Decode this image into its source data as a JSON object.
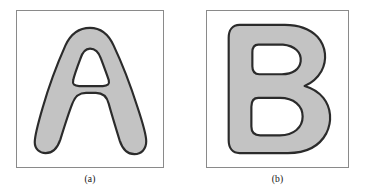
{
  "figure": {
    "background_color": "#ffffff",
    "panel_border_color": "#8a8a8a",
    "shape_fill_color": "#c3c3c3",
    "shape_outline_color": "#2b2b2b",
    "counter_fill_color": "#ffffff"
  },
  "panels": [
    {
      "id": "a",
      "caption": "(a)",
      "shape_label": "A",
      "shape_description": "rounded blob letter A with triangular counter and two splayed legs"
    },
    {
      "id": "b",
      "caption": "(b)",
      "shape_label": "B",
      "shape_description": "rounded blob letter B with upper oval counter and lower rounded counter"
    }
  ]
}
